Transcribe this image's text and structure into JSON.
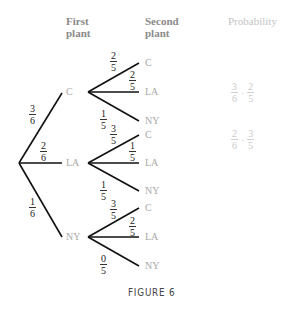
{
  "headers": {
    "first_plant": [
      "First",
      "plant"
    ],
    "second_plant": [
      "Second",
      "plant"
    ],
    "probability": "Probability"
  },
  "tree": {
    "root_branches": [
      {
        "label": "C",
        "num": "3",
        "den": "6"
      },
      {
        "label": "LA",
        "num": "2",
        "den": "6"
      },
      {
        "label": "NY",
        "num": "1",
        "den": "6"
      }
    ],
    "second_level": {
      "C": [
        {
          "label": "C",
          "num": "2",
          "den": "5"
        },
        {
          "label": "LA",
          "num": "2",
          "den": "5"
        },
        {
          "label": "NY",
          "num": "1",
          "den": "5"
        }
      ],
      "LA": [
        {
          "label": "C",
          "num": "3",
          "den": "5"
        },
        {
          "label": "LA",
          "num": "1",
          "den": "5"
        },
        {
          "label": "NY",
          "num": "1",
          "den": "5"
        }
      ],
      "NY": [
        {
          "label": "C",
          "num": "3",
          "den": "5"
        },
        {
          "label": "LA",
          "num": "2",
          "den": "5"
        },
        {
          "label": "NY",
          "num": "0",
          "den": "5"
        }
      ]
    }
  },
  "probabilities": [
    {
      "a_num": "3",
      "a_den": "6",
      "op": "·",
      "b_num": "2",
      "b_den": "5"
    },
    {
      "a_num": "2",
      "a_den": "6",
      "op": "·",
      "b_num": "3",
      "b_den": "5"
    }
  ],
  "caption": "FIGURE 6",
  "colors": {
    "lines": "#111111",
    "node_labels": "#a8a8a8",
    "headers": "#8a8a8a"
  }
}
